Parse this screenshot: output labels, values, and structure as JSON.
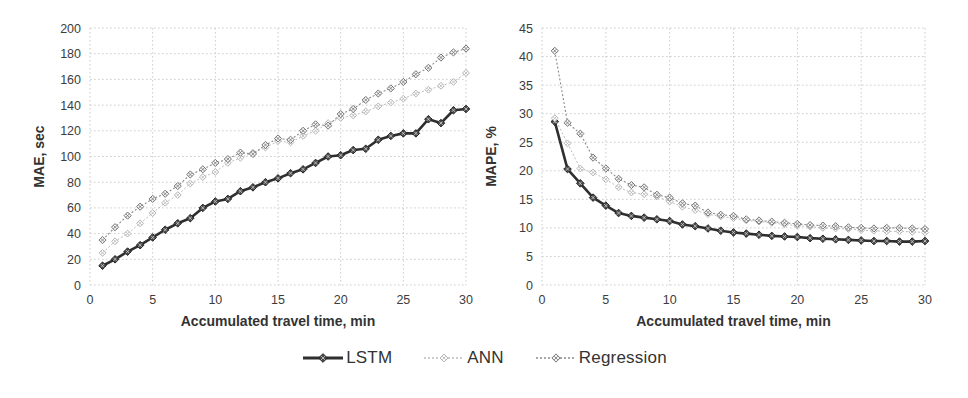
{
  "page": {
    "background": "#ffffff",
    "grid_color": "#cdcdcd",
    "text_color": "#3d3d3d"
  },
  "legend": {
    "items": [
      {
        "label": "LSTM",
        "color": "#2f2f2f",
        "line_width": 2.6,
        "dash": "",
        "marker": "diamond-x",
        "marker_size": 3.8,
        "marker_fill": "#4a4a4a",
        "marker_stroke": "#222222",
        "cross_color": "#d0d0d0"
      },
      {
        "label": "ANN",
        "color": "#bcbcbc",
        "line_width": 1,
        "dash": "2 2",
        "marker": "diamond-x",
        "marker_size": 3.4,
        "marker_fill": "#ffffff",
        "marker_stroke": "#b3b3b3",
        "cross_color": "#b3b3b3"
      },
      {
        "label": "Regression",
        "color": "#8a8a8a",
        "line_width": 1.1,
        "dash": "2 2",
        "marker": "diamond-x",
        "marker_size": 3.6,
        "marker_fill": "#f2f2f2",
        "marker_stroke": "#767676",
        "cross_color": "#767676"
      }
    ]
  },
  "chart_data": [
    {
      "type": "line",
      "title": "",
      "xlabel": "Accumulated travel time, min",
      "ylabel": "MAE, sec",
      "xlim": [
        0,
        30
      ],
      "ylim": [
        0,
        200
      ],
      "xticks": [
        0,
        5,
        10,
        15,
        20,
        25,
        30
      ],
      "yticks": [
        0,
        20,
        40,
        60,
        80,
        100,
        120,
        140,
        160,
        180,
        200
      ],
      "grid": true,
      "x": [
        1,
        2,
        3,
        4,
        5,
        6,
        7,
        8,
        9,
        10,
        11,
        12,
        13,
        14,
        15,
        16,
        17,
        18,
        19,
        20,
        21,
        22,
        23,
        24,
        25,
        26,
        27,
        28,
        29,
        30
      ],
      "series": [
        {
          "name": "LSTM",
          "values": [
            15,
            20,
            26,
            31,
            37,
            43,
            48,
            52,
            60,
            65,
            67,
            73,
            76,
            80,
            83,
            87,
            90,
            95,
            100,
            101,
            105,
            106,
            113,
            116,
            118,
            118,
            129,
            126,
            136,
            137
          ]
        },
        {
          "name": "ANN",
          "values": [
            25,
            34,
            40,
            48,
            56,
            64,
            70,
            79,
            84,
            88,
            95,
            99,
            103,
            107,
            112,
            111,
            116,
            120,
            126,
            130,
            132,
            135,
            139,
            142,
            145,
            149,
            152,
            155,
            158,
            165
          ]
        },
        {
          "name": "Regression",
          "values": [
            35,
            45,
            54,
            61,
            67,
            71,
            77,
            86,
            90,
            95,
            98,
            103,
            102,
            109,
            114,
            113,
            120,
            125,
            124,
            133,
            137,
            144,
            149,
            153,
            158,
            164,
            169,
            177,
            181,
            184
          ]
        }
      ]
    },
    {
      "type": "line",
      "title": "",
      "xlabel": "Accumulated travel time, min",
      "ylabel": "MAPE, %",
      "xlim": [
        0,
        30
      ],
      "ylim": [
        0,
        45
      ],
      "xticks": [
        0,
        5,
        10,
        15,
        20,
        25,
        30
      ],
      "yticks": [
        0,
        5,
        10,
        15,
        20,
        25,
        30,
        35,
        40,
        45
      ],
      "grid": true,
      "x": [
        1,
        2,
        3,
        4,
        5,
        6,
        7,
        8,
        9,
        10,
        11,
        12,
        13,
        14,
        15,
        16,
        17,
        18,
        19,
        20,
        21,
        22,
        23,
        24,
        25,
        26,
        27,
        28,
        29,
        30
      ],
      "series": [
        {
          "name": "LSTM",
          "values": [
            28.6,
            20.3,
            17.8,
            15.3,
            13.9,
            12.6,
            12.1,
            11.8,
            11.5,
            11.2,
            10.6,
            10.3,
            9.9,
            9.5,
            9.2,
            9.0,
            8.8,
            8.6,
            8.5,
            8.4,
            8.2,
            8.1,
            8.0,
            7.9,
            7.8,
            7.7,
            7.7,
            7.6,
            7.6,
            7.7
          ]
        },
        {
          "name": "ANN",
          "values": [
            29.2,
            24.8,
            20.4,
            19.7,
            18.5,
            17.1,
            16.2,
            15.9,
            15.5,
            14.6,
            13.7,
            13.1,
            12.4,
            12.0,
            11.7,
            11.3,
            11.1,
            10.9,
            10.6,
            10.4,
            10.2,
            10.0,
            9.9,
            9.8,
            9.6,
            9.5,
            9.4,
            9.4,
            9.3,
            9.2
          ]
        },
        {
          "name": "Regression",
          "values": [
            41.0,
            28.4,
            26.5,
            22.3,
            20.4,
            18.6,
            17.5,
            17.1,
            15.8,
            15.3,
            14.3,
            13.9,
            12.7,
            12.3,
            12.1,
            11.5,
            11.3,
            11.1,
            10.9,
            10.7,
            10.5,
            10.4,
            10.3,
            10.1,
            10.0,
            9.9,
            10.0,
            10.0,
            9.9,
            9.8
          ]
        }
      ]
    }
  ]
}
